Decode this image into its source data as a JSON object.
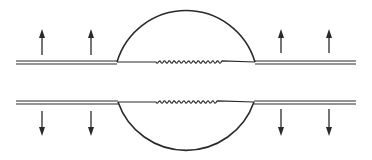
{
  "diagram": {
    "colors": {
      "ink": "#2a2a2a",
      "background": "#ffffff"
    },
    "upper_plate": {
      "arrows": [
        "up",
        "up",
        "up",
        "up"
      ]
    },
    "lower_plate": {
      "arrows": [
        "down",
        "down",
        "down",
        "down"
      ]
    },
    "interface": {
      "style": "wavy"
    }
  }
}
